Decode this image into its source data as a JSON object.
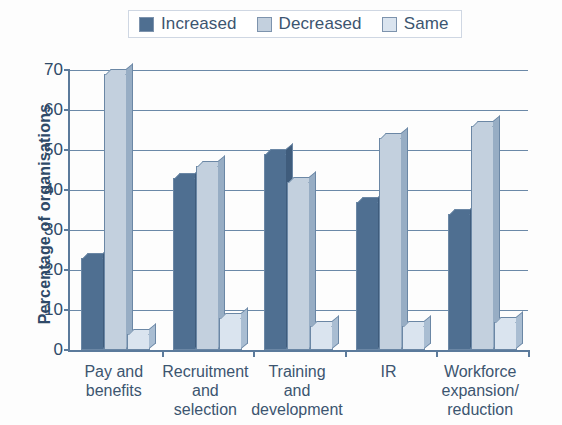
{
  "chart_data": {
    "type": "bar",
    "title": "",
    "xlabel": "",
    "ylabel": "Percentage of organisations",
    "ylim": [
      0,
      70
    ],
    "ytick_step": 10,
    "yticks": [
      "70",
      "60",
      "50",
      "40",
      "30",
      "20",
      "10",
      "0"
    ],
    "grid": true,
    "legend_position": "top",
    "categories": [
      "Pay and benefits",
      "Recruitment and selection",
      "Training and development",
      "IR",
      "Workforce expansion/ reduction"
    ],
    "category_lines": [
      [
        "Pay and",
        "benefits"
      ],
      [
        "Recruitment",
        "and",
        "selection"
      ],
      [
        "Training",
        "and",
        "development"
      ],
      [
        "IR"
      ],
      [
        "Workforce",
        "expansion/",
        "reduction"
      ]
    ],
    "series": [
      {
        "name": "Increased",
        "color": "#4f6f91",
        "values": [
          23,
          43,
          49,
          37,
          34
        ]
      },
      {
        "name": "Decreased",
        "color": "#c3d0de",
        "values": [
          69,
          46,
          42,
          53,
          56
        ]
      },
      {
        "name": "Same",
        "color": "#dae4ef",
        "values": [
          4,
          8,
          6,
          6,
          7
        ]
      }
    ]
  },
  "legend": {
    "entries": [
      {
        "label": "Increased"
      },
      {
        "label": "Decreased"
      },
      {
        "label": "Same"
      }
    ]
  },
  "axis": {
    "y_title": "Percentage of organisations"
  }
}
